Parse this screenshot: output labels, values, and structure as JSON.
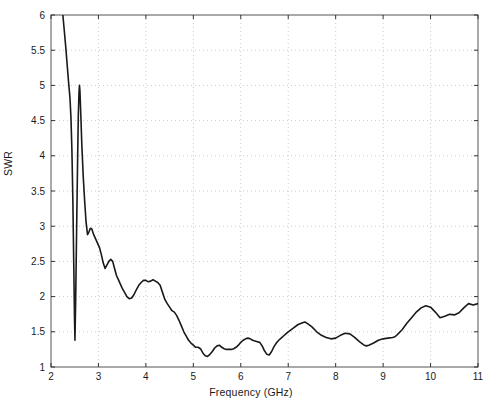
{
  "figure": {
    "background": "#ffffff",
    "plot_area": {
      "left": 51,
      "top": 15,
      "right": 478,
      "bottom": 367
    }
  },
  "axis_label_x": "Frequency (GHz)",
  "axis_label_y": "SWR",
  "chart_data": {
    "type": "line",
    "title": "",
    "xlabel": "Frequency (GHz)",
    "ylabel": "SWR",
    "xlim": [
      2,
      11
    ],
    "ylim": [
      1,
      6
    ],
    "xticks": [
      2,
      3,
      4,
      5,
      6,
      7,
      8,
      9,
      10,
      11
    ],
    "xtick_labels": [
      "2",
      "3",
      "4",
      "5",
      "6",
      "7",
      "8",
      "9",
      "10",
      "11"
    ],
    "yticks": [
      1,
      1.5,
      2,
      2.5,
      3,
      3.5,
      4,
      4.5,
      5,
      5.5,
      6
    ],
    "ytick_labels": [
      "1",
      "1.5",
      "2",
      "2.5",
      "3",
      "3.5",
      "4",
      "4.5",
      "5",
      "5.5",
      "6"
    ],
    "grid": true,
    "grid_style": "dotted",
    "grid_color": "#bfbfbf",
    "legend": null,
    "legend_position": "none",
    "series": [
      {
        "name": "SWR",
        "color": "#1a1a1a",
        "linewidth": 1.6,
        "x": [
          2.25,
          2.28,
          2.31,
          2.34,
          2.37,
          2.4,
          2.42,
          2.44,
          2.46,
          2.48,
          2.495,
          2.505,
          2.52,
          2.54,
          2.56,
          2.575,
          2.59,
          2.6,
          2.61,
          2.63,
          2.65,
          2.68,
          2.71,
          2.74,
          2.77,
          2.8,
          2.83,
          2.86,
          2.9,
          2.94,
          2.98,
          3.02,
          3.06,
          3.1,
          3.14,
          3.18,
          3.22,
          3.26,
          3.3,
          3.34,
          3.38,
          3.42,
          3.46,
          3.5,
          3.55,
          3.6,
          3.65,
          3.7,
          3.75,
          3.8,
          3.85,
          3.9,
          3.95,
          4.0,
          4.05,
          4.1,
          4.15,
          4.2,
          4.25,
          4.3,
          4.35,
          4.4,
          4.45,
          4.5,
          4.55,
          4.6,
          4.65,
          4.7,
          4.75,
          4.8,
          4.85,
          4.9,
          4.95,
          5.0,
          5.05,
          5.1,
          5.15,
          5.2,
          5.25,
          5.3,
          5.35,
          5.4,
          5.45,
          5.5,
          5.55,
          5.6,
          5.65,
          5.7,
          5.75,
          5.8,
          5.85,
          5.9,
          5.95,
          6.0,
          6.05,
          6.1,
          6.15,
          6.2,
          6.25,
          6.3,
          6.35,
          6.4,
          6.45,
          6.5,
          6.55,
          6.6,
          6.65,
          6.7,
          6.75,
          6.8,
          6.85,
          6.9,
          6.95,
          7.0,
          7.1,
          7.2,
          7.3,
          7.35,
          7.4,
          7.5,
          7.6,
          7.7,
          7.8,
          7.9,
          8.0,
          8.1,
          8.2,
          8.3,
          8.4,
          8.5,
          8.6,
          8.65,
          8.7,
          8.8,
          8.9,
          9.0,
          9.1,
          9.2,
          9.25,
          9.3,
          9.4,
          9.5,
          9.6,
          9.7,
          9.8,
          9.9,
          10.0,
          10.1,
          10.2,
          10.3,
          10.4,
          10.5,
          10.6,
          10.7,
          10.8,
          10.9,
          11.0
        ],
        "y": [
          6.0,
          5.78,
          5.55,
          5.3,
          5.05,
          4.82,
          4.55,
          4.1,
          3.4,
          2.45,
          1.7,
          1.38,
          1.95,
          2.95,
          3.9,
          4.55,
          4.9,
          5.0,
          4.92,
          4.55,
          4.15,
          3.7,
          3.35,
          3.05,
          2.88,
          2.92,
          2.97,
          2.96,
          2.88,
          2.82,
          2.76,
          2.7,
          2.6,
          2.48,
          2.4,
          2.45,
          2.5,
          2.53,
          2.5,
          2.4,
          2.3,
          2.24,
          2.18,
          2.12,
          2.06,
          2.0,
          1.97,
          1.98,
          2.03,
          2.1,
          2.16,
          2.2,
          2.23,
          2.23,
          2.21,
          2.22,
          2.24,
          2.22,
          2.2,
          2.16,
          2.06,
          1.96,
          1.9,
          1.85,
          1.8,
          1.78,
          1.73,
          1.66,
          1.58,
          1.5,
          1.44,
          1.38,
          1.34,
          1.31,
          1.28,
          1.28,
          1.26,
          1.2,
          1.16,
          1.15,
          1.18,
          1.22,
          1.27,
          1.3,
          1.31,
          1.28,
          1.26,
          1.25,
          1.25,
          1.25,
          1.26,
          1.28,
          1.31,
          1.35,
          1.38,
          1.4,
          1.41,
          1.4,
          1.38,
          1.37,
          1.36,
          1.35,
          1.3,
          1.23,
          1.18,
          1.17,
          1.22,
          1.29,
          1.34,
          1.38,
          1.41,
          1.44,
          1.47,
          1.5,
          1.55,
          1.6,
          1.63,
          1.64,
          1.62,
          1.57,
          1.5,
          1.45,
          1.42,
          1.4,
          1.41,
          1.45,
          1.48,
          1.47,
          1.42,
          1.36,
          1.31,
          1.3,
          1.31,
          1.34,
          1.38,
          1.4,
          1.41,
          1.42,
          1.43,
          1.46,
          1.53,
          1.62,
          1.7,
          1.78,
          1.84,
          1.87,
          1.85,
          1.78,
          1.7,
          1.72,
          1.75,
          1.74,
          1.77,
          1.84,
          1.9,
          1.88,
          1.9
        ]
      }
    ]
  }
}
